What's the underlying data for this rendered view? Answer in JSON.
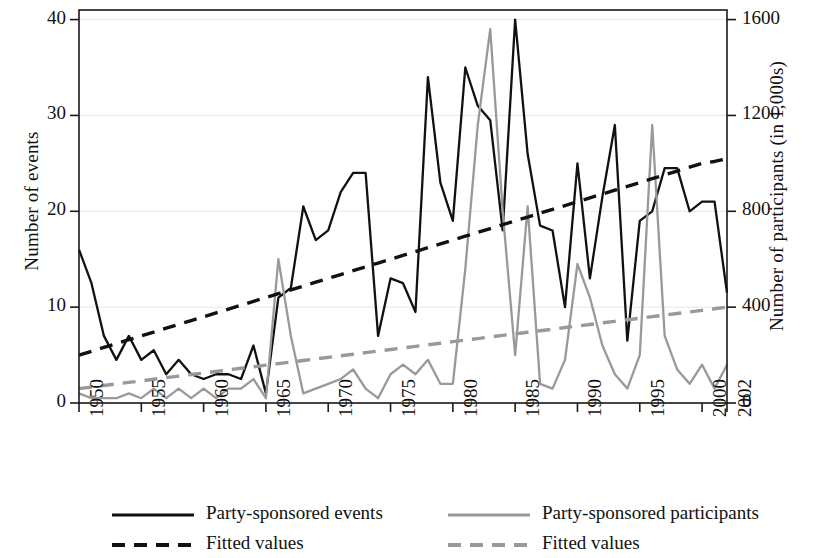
{
  "chart_data": {
    "type": "line",
    "title": "",
    "xlabel": "",
    "ylabel": "Number of events",
    "ylabel_right": "Number of participants (in 1,000s)",
    "xlim": [
      1950,
      2002
    ],
    "ylim": [
      0,
      41
    ],
    "ylim_right": [
      0,
      1640
    ],
    "yticks": [
      0,
      10,
      20,
      30,
      40
    ],
    "yticks_right": [
      0,
      400,
      800,
      1200,
      1600
    ],
    "xticks": [
      1950,
      1955,
      1960,
      1965,
      1970,
      1975,
      1980,
      1985,
      1990,
      1995,
      2000,
      2002
    ],
    "grid": "horizontal-light",
    "legend_position": "below-plot",
    "x": [
      1950,
      1951,
      1952,
      1953,
      1954,
      1955,
      1956,
      1957,
      1958,
      1959,
      1960,
      1961,
      1962,
      1963,
      1964,
      1965,
      1966,
      1967,
      1968,
      1969,
      1970,
      1971,
      1972,
      1973,
      1974,
      1975,
      1976,
      1977,
      1978,
      1979,
      1980,
      1981,
      1982,
      1983,
      1984,
      1985,
      1986,
      1987,
      1988,
      1989,
      1990,
      1991,
      1992,
      1993,
      1994,
      1995,
      1996,
      1997,
      1998,
      1999,
      2000,
      2001,
      2002
    ],
    "series": [
      {
        "name": "Party-sponsored events",
        "color": "#111111",
        "style": "solid",
        "axis": "left",
        "values": [
          16,
          12.5,
          7,
          4.5,
          7,
          4.5,
          5.5,
          3,
          4.5,
          3,
          2.5,
          3,
          3,
          2.5,
          6,
          1,
          11,
          12,
          20.5,
          17,
          18,
          22,
          24,
          24,
          7,
          13,
          12.5,
          9.5,
          34,
          23,
          19,
          35,
          31,
          29.5,
          18,
          40,
          26,
          18.5,
          18,
          10,
          25,
          13,
          21.5,
          29,
          6.5,
          19,
          20,
          24.5,
          24.5,
          20,
          21,
          21,
          11.5
        ]
      },
      {
        "name": "Party-sponsored participants",
        "color": "#999999",
        "style": "solid",
        "axis": "right",
        "values": [
          1,
          0.5,
          0.5,
          0.5,
          1,
          0.5,
          1.5,
          0.5,
          1.5,
          0.5,
          1.5,
          0.5,
          1.5,
          1.5,
          2.5,
          0.5,
          15,
          7,
          1,
          1.5,
          2,
          2.5,
          3.5,
          1.5,
          0.5,
          3,
          4,
          3,
          4.5,
          2,
          2,
          14,
          29,
          39,
          20,
          5,
          20.5,
          2,
          1.5,
          4.5,
          14.5,
          11,
          6,
          3,
          1.5,
          5,
          29,
          7,
          3.5,
          2,
          4,
          1.5,
          4
        ]
      },
      {
        "name": "Fitted values",
        "color": "#111111",
        "style": "dashed",
        "axis": "left",
        "values": [
          5,
          5.4,
          5.8,
          6.2,
          6.6,
          7,
          7.4,
          7.8,
          8.2,
          8.6,
          9,
          9.4,
          9.8,
          10.2,
          10.6,
          11,
          11.4,
          11.8,
          12.2,
          12.6,
          13,
          13.4,
          13.8,
          14.2,
          14.6,
          15,
          15.4,
          15.8,
          16.2,
          16.6,
          17,
          17.4,
          17.8,
          18.2,
          18.6,
          19,
          19.4,
          19.8,
          20.2,
          20.6,
          21,
          21.4,
          21.8,
          22.2,
          22.6,
          23,
          23.4,
          23.8,
          24.2,
          24.6,
          25,
          25.2,
          25.5
        ]
      },
      {
        "name": "Fitted values",
        "color": "#999999",
        "style": "dashed",
        "axis": "right",
        "values": [
          1.5,
          1.66,
          1.82,
          1.99,
          2.15,
          2.31,
          2.48,
          2.64,
          2.8,
          2.97,
          3.13,
          3.29,
          3.46,
          3.62,
          3.78,
          3.95,
          4.11,
          4.27,
          4.44,
          4.6,
          4.76,
          4.93,
          5.09,
          5.25,
          5.42,
          5.58,
          5.74,
          5.91,
          6.07,
          6.23,
          6.4,
          6.56,
          6.72,
          6.89,
          7.05,
          7.21,
          7.38,
          7.54,
          7.7,
          7.87,
          8.03,
          8.19,
          8.36,
          8.52,
          8.68,
          8.85,
          9.01,
          9.17,
          9.34,
          9.5,
          9.66,
          9.83,
          10
        ]
      }
    ]
  },
  "legend": {
    "entries": [
      {
        "label": "Party-sponsored events",
        "color": "#111111",
        "style": "solid"
      },
      {
        "label": "Party-sponsored participants",
        "color": "#999999",
        "style": "solid"
      },
      {
        "label": "Fitted values",
        "color": "#111111",
        "style": "dashed"
      },
      {
        "label": "Fitted values",
        "color": "#999999",
        "style": "dashed"
      }
    ]
  }
}
